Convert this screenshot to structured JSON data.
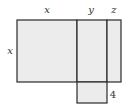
{
  "diagram": {
    "type": "area-model",
    "labels": {
      "top_x": "x",
      "top_y": "y",
      "top_z": "z",
      "left_x": "x",
      "bottom_right": "4"
    },
    "colors": {
      "fill": "#ececec",
      "stroke": "#2a2a2a"
    }
  }
}
